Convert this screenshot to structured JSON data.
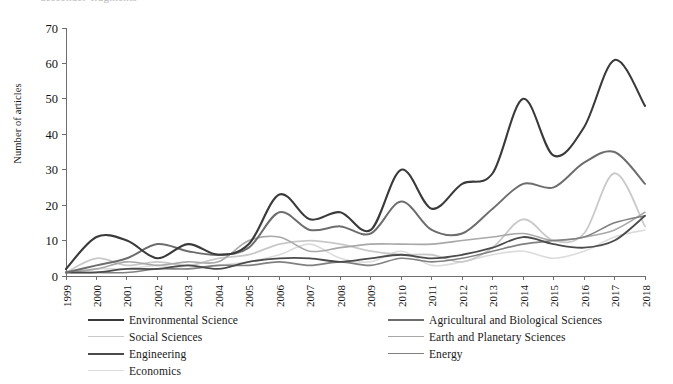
{
  "top_cropped_text": "descender-fragments",
  "chart_data": {
    "type": "line",
    "title": "",
    "xlabel": "",
    "ylabel": "Number of articles",
    "ylim": [
      0,
      70
    ],
    "yticks": [
      0,
      10,
      20,
      30,
      40,
      50,
      60,
      70
    ],
    "grid": false,
    "legend_position": "bottom",
    "x": [
      1999,
      2000,
      2001,
      2002,
      2003,
      2004,
      2005,
      2006,
      2007,
      2008,
      2009,
      2010,
      2011,
      2012,
      2013,
      2014,
      2015,
      2016,
      2017,
      2018
    ],
    "categories": [
      "1999",
      "2000",
      "2001",
      "2002",
      "2003",
      "2004",
      "2005",
      "2006",
      "2007",
      "2008",
      "2009",
      "2010",
      "2011",
      "2012",
      "2013",
      "2014",
      "2015",
      "2016",
      "2017",
      "2018"
    ],
    "series": [
      {
        "name": "Environmental Science",
        "color": "#3a3a3a",
        "width": 2.1,
        "values": [
          2,
          11,
          10,
          5,
          9,
          6,
          9,
          23,
          16,
          18,
          13,
          30,
          19,
          26,
          29,
          50,
          34,
          42,
          61,
          48
        ]
      },
      {
        "name": "Agricultural and Biological Sciences",
        "color": "#6d6d6d",
        "width": 2.0,
        "values": [
          1,
          3,
          5,
          9,
          7,
          6,
          8,
          18,
          13,
          14,
          12,
          21,
          13,
          12,
          19,
          26,
          25,
          32,
          35,
          26
        ]
      },
      {
        "name": "Social Sciences",
        "color": "#c9c9c9",
        "width": 1.8,
        "values": [
          1,
          5,
          3,
          4,
          3,
          5,
          6,
          9,
          10,
          9,
          7,
          6,
          6,
          4,
          8,
          16,
          10,
          12,
          29,
          14
        ]
      },
      {
        "name": "Earth and Planetary Sciences",
        "color": "#a8a8a8",
        "width": 1.6,
        "values": [
          1,
          2,
          4,
          3,
          4,
          4,
          10,
          11,
          7,
          8,
          9,
          9,
          9,
          10,
          11,
          12,
          10,
          11,
          13,
          18
        ]
      },
      {
        "name": "Engineering",
        "color": "#4b4b4b",
        "width": 1.8,
        "values": [
          1,
          1,
          2,
          2,
          3,
          2,
          4,
          5,
          5,
          4,
          5,
          6,
          5,
          6,
          8,
          11,
          9,
          8,
          10,
          17
        ]
      },
      {
        "name": "Energy",
        "color": "#808080",
        "width": 1.6,
        "values": [
          1,
          1,
          1,
          2,
          2,
          3,
          3,
          4,
          3,
          4,
          3,
          5,
          4,
          5,
          7,
          9,
          10,
          11,
          15,
          17
        ]
      },
      {
        "name": "Economics",
        "color": "#dcdcdc",
        "width": 1.6,
        "values": [
          1,
          2,
          2,
          3,
          2,
          3,
          4,
          6,
          9,
          5,
          4,
          7,
          3,
          4,
          6,
          7,
          5,
          7,
          11,
          13
        ]
      }
    ]
  },
  "legend": {
    "left_column": [
      {
        "label": "Environmental Science",
        "color": "#3a3a3a",
        "width": 2.2
      },
      {
        "label": "Social Sciences",
        "color": "#c9c9c9",
        "width": 1.6
      },
      {
        "label": "Engineering",
        "color": "#4b4b4b",
        "width": 2.0
      },
      {
        "label": "Economics",
        "color": "#dcdcdc",
        "width": 1.6
      }
    ],
    "right_column": [
      {
        "label": "Agricultural and Biological Sciences",
        "color": "#6d6d6d",
        "width": 2.0
      },
      {
        "label": "Earth and Planetary Sciences",
        "color": "#a8a8a8",
        "width": 1.6
      },
      {
        "label": "Energy",
        "color": "#808080",
        "width": 1.8
      }
    ]
  }
}
